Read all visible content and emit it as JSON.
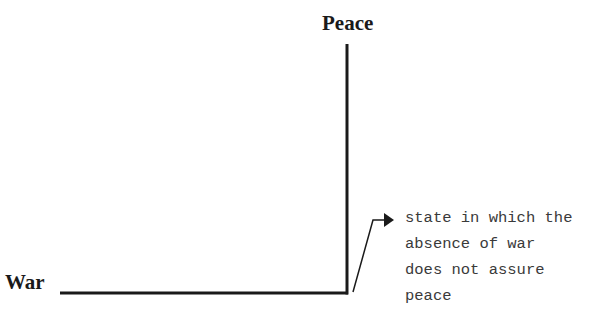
{
  "diagram": {
    "axis_top_label": "Peace",
    "axis_left_label": "War",
    "annotation": {
      "lines": [
        "state in which the",
        "absence of war",
        "does not assure",
        "peace"
      ]
    },
    "colors": {
      "line": "#1a1a1a",
      "text": "#3a3a3a",
      "background": "#ffffff"
    }
  }
}
